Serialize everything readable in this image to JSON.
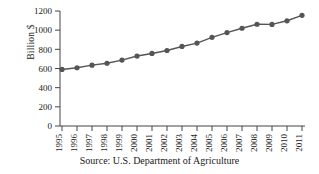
{
  "chart_data": {
    "type": "line",
    "title": "",
    "xlabel": "",
    "ylabel": "Billion $",
    "categories": [
      "1995",
      "1996",
      "1997",
      "1998",
      "1999",
      "2000",
      "2001",
      "2002",
      "2003",
      "2004",
      "2005",
      "2006",
      "2007",
      "2008",
      "2009",
      "2010",
      "2011"
    ],
    "values": [
      590,
      608,
      635,
      655,
      688,
      730,
      757,
      788,
      830,
      865,
      925,
      975,
      1020,
      1062,
      1060,
      1098,
      1155
    ],
    "series": [
      {
        "name": "Billion $",
        "values": [
          590,
          608,
          635,
          655,
          688,
          730,
          757,
          788,
          830,
          865,
          925,
          975,
          1020,
          1062,
          1060,
          1098,
          1155
        ]
      }
    ],
    "ylim": [
      0,
      1200
    ],
    "yticks": [
      0,
      200,
      400,
      600,
      800,
      1000,
      1200
    ],
    "ytick_labels": [
      "0",
      "200",
      "400",
      "600",
      "800",
      "1000",
      "1200"
    ],
    "grid": false,
    "legend": "none",
    "marker": "circle",
    "line_color": "#555555",
    "marker_color": "#555555",
    "axis_color": "#444444",
    "annotations": [
      "Source: U.S. Department of Agriculture"
    ]
  },
  "caption": {
    "source_text": "Source: U.S. Department of Agriculture"
  }
}
